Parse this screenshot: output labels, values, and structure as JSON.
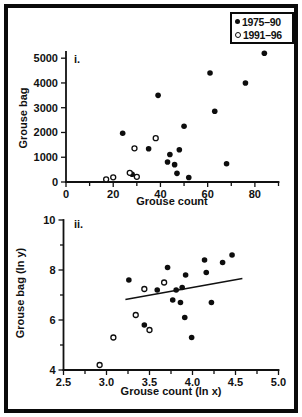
{
  "figure_title": "",
  "legend": {
    "items": [
      {
        "marker": "filled",
        "label": "1975–90"
      },
      {
        "marker": "open",
        "label": "1991–96"
      }
    ]
  },
  "colors": {
    "ink": "#111111",
    "background": "#ffffff",
    "marker_fill": "#0d0d0d"
  },
  "chart_data": [
    {
      "type": "scatter",
      "panel_label": "i.",
      "xlabel": "Grouse count",
      "ylabel": "Grouse bag",
      "xlim": [
        0,
        90
      ],
      "ylim": [
        0,
        5250
      ],
      "grid": false,
      "legend_position": "top-right",
      "x_major_ticks": [
        0,
        20,
        40,
        60,
        80
      ],
      "x_tick_labels": [
        "0",
        "20",
        "40",
        "60",
        "80"
      ],
      "x_minor_ticks": [
        10,
        30,
        50,
        70,
        90
      ],
      "y_major_ticks": [
        0,
        1000,
        2000,
        3000,
        4000,
        5000
      ],
      "y_tick_labels": [
        "0",
        "1000",
        "2000",
        "3000",
        "4000",
        "5000"
      ],
      "y_minor_ticks": [],
      "series": [
        {
          "name": "1975–90",
          "marker": "filled",
          "points": [
            [
              24,
              1970
            ],
            [
              28,
              310
            ],
            [
              35,
              1340
            ],
            [
              39,
              3500
            ],
            [
              43,
              810
            ],
            [
              44,
              1110
            ],
            [
              46,
              700
            ],
            [
              47,
              350
            ],
            [
              48,
              1300
            ],
            [
              50,
              2250
            ],
            [
              52,
              180
            ],
            [
              61,
              4400
            ],
            [
              63,
              2860
            ],
            [
              68,
              740
            ],
            [
              76,
              4000
            ],
            [
              84,
              5200
            ]
          ]
        },
        {
          "name": "1991–96",
          "marker": "open",
          "points": [
            [
              17,
              110
            ],
            [
              20,
              190
            ],
            [
              27,
              370
            ],
            [
              29,
              1360
            ],
            [
              30,
              210
            ],
            [
              38,
              1770
            ]
          ]
        }
      ]
    },
    {
      "type": "scatter",
      "panel_label": "ii.",
      "xlabel": "Grouse count (ln x)",
      "ylabel": "Grouse bag (ln y)",
      "xlim": [
        2.5,
        5.0
      ],
      "ylim": [
        4,
        10
      ],
      "grid": false,
      "x_major_ticks": [
        2.5,
        3.0,
        3.5,
        4.0,
        4.5,
        5.0
      ],
      "x_tick_labels": [
        "2.5",
        "3.0",
        "3.5",
        "4.0",
        "4.5",
        "5.0"
      ],
      "x_minor_ticks": [
        2.75,
        3.25,
        3.75,
        4.25,
        4.75
      ],
      "y_major_ticks": [
        4,
        6,
        8,
        10
      ],
      "y_tick_labels": [
        "4",
        "6",
        "8",
        "10"
      ],
      "y_minor_ticks": [
        5,
        7,
        9
      ],
      "trend_line": {
        "x1": 3.22,
        "y1": 6.82,
        "x2": 4.58,
        "y2": 7.66
      },
      "series": [
        {
          "name": "1975–90",
          "marker": "filled",
          "points": [
            [
              3.26,
              7.6
            ],
            [
              3.44,
              5.8
            ],
            [
              3.59,
              7.2
            ],
            [
              3.71,
              8.1
            ],
            [
              3.77,
              6.8
            ],
            [
              3.81,
              7.2
            ],
            [
              3.86,
              6.7
            ],
            [
              3.88,
              7.3
            ],
            [
              3.91,
              6.1
            ],
            [
              3.92,
              7.8
            ],
            [
              3.99,
              5.3
            ],
            [
              4.14,
              8.4
            ],
            [
              4.16,
              7.9
            ],
            [
              4.22,
              6.7
            ],
            [
              4.35,
              8.3
            ],
            [
              4.46,
              8.6
            ]
          ]
        },
        {
          "name": "1991–96",
          "marker": "open",
          "points": [
            [
              2.92,
              4.2
            ],
            [
              3.08,
              5.3
            ],
            [
              3.34,
              6.2
            ],
            [
              3.44,
              7.24
            ],
            [
              3.5,
              5.6
            ],
            [
              3.67,
              7.5
            ]
          ]
        }
      ]
    }
  ]
}
